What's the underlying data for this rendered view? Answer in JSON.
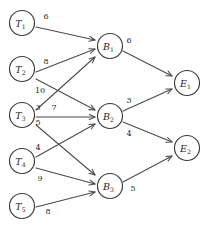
{
  "diagram": {
    "type": "directed-graph",
    "stroke_color": "#4a4a4a",
    "node_fill": "#ffffff",
    "text_color": "#1f1f1f",
    "node_radius": 12.5,
    "layers": [
      {
        "name": "sources",
        "prefix": "T",
        "nodes": [
          {
            "id": "T1",
            "base": "T",
            "sub": "1",
            "cx": 22,
            "cy": 23
          },
          {
            "id": "T2",
            "base": "T",
            "sub": "2",
            "cx": 22,
            "cy": 69
          },
          {
            "id": "T3",
            "base": "T",
            "sub": "3",
            "cx": 22,
            "cy": 115
          },
          {
            "id": "T4",
            "base": "T",
            "sub": "4",
            "cx": 22,
            "cy": 161
          },
          {
            "id": "T5",
            "base": "T",
            "sub": "5",
            "cx": 22,
            "cy": 206
          }
        ]
      },
      {
        "name": "intermediate",
        "prefix": "B",
        "nodes": [
          {
            "id": "B1",
            "base": "B",
            "sub": "1",
            "cx": 110,
            "cy": 46
          },
          {
            "id": "B2",
            "base": "B",
            "sub": "2",
            "cx": 110,
            "cy": 116
          },
          {
            "id": "B3",
            "base": "B",
            "sub": "3",
            "cx": 110,
            "cy": 186
          }
        ]
      },
      {
        "name": "sinks",
        "prefix": "E",
        "nodes": [
          {
            "id": "E1",
            "base": "E",
            "sub": "1",
            "cx": 187,
            "cy": 83
          },
          {
            "id": "E2",
            "base": "E",
            "sub": "2",
            "cx": 187,
            "cy": 148
          }
        ]
      }
    ],
    "edges": [
      {
        "id": "T1-B1",
        "from": "T1",
        "to": "B1",
        "weight": "6",
        "x1": 36,
        "y1": 27,
        "x2": 95,
        "y2": 40,
        "lx": 46,
        "ly": 16
      },
      {
        "id": "T2-B1",
        "from": "T2",
        "to": "B1",
        "weight": "8",
        "x1": 36,
        "y1": 72,
        "x2": 95,
        "y2": 49,
        "lx": 46,
        "ly": 61
      },
      {
        "id": "T2-B2",
        "from": "T2",
        "to": "B2",
        "weight": "10",
        "x1": 36,
        "y1": 79,
        "x2": 95,
        "y2": 110,
        "lx": 40,
        "ly": 90
      },
      {
        "id": "T3-B1",
        "from": "T3",
        "to": "B1",
        "weight": "3",
        "x1": 36,
        "y1": 110,
        "x2": 95,
        "y2": 57,
        "lx": 38,
        "ly": 107
      },
      {
        "id": "T3-B2",
        "from": "T3",
        "to": "B2",
        "weight": "7",
        "x1": 36,
        "y1": 117,
        "x2": 95,
        "y2": 117,
        "lx": 54,
        "ly": 107
      },
      {
        "id": "T3-B3",
        "from": "T3",
        "to": "B3",
        "weight": "5",
        "x1": 36,
        "y1": 125,
        "x2": 95,
        "y2": 175,
        "lx": 38,
        "ly": 122
      },
      {
        "id": "T4-B2",
        "from": "T4",
        "to": "B2",
        "weight": "4",
        "x1": 36,
        "y1": 157,
        "x2": 95,
        "y2": 124,
        "lx": 38,
        "ly": 147
      },
      {
        "id": "T4-B3",
        "from": "T4",
        "to": "B3",
        "weight": "9",
        "x1": 36,
        "y1": 168,
        "x2": 95,
        "y2": 184,
        "lx": 40,
        "ly": 178
      },
      {
        "id": "T5-B3",
        "from": "T5",
        "to": "B3",
        "weight": "8",
        "x1": 36,
        "y1": 207,
        "x2": 95,
        "y2": 192,
        "lx": 48,
        "ly": 211
      },
      {
        "id": "B1-E1",
        "from": "B1",
        "to": "E1",
        "weight": "6",
        "x1": 123,
        "y1": 51,
        "x2": 172,
        "y2": 76,
        "lx": 129,
        "ly": 40
      },
      {
        "id": "B2-E1",
        "from": "B2",
        "to": "E1",
        "weight": "3",
        "x1": 123,
        "y1": 111,
        "x2": 172,
        "y2": 89,
        "lx": 129,
        "ly": 100
      },
      {
        "id": "B2-E2",
        "from": "B2",
        "to": "E2",
        "weight": "4",
        "x1": 123,
        "y1": 122,
        "x2": 172,
        "y2": 142,
        "lx": 129,
        "ly": 133
      },
      {
        "id": "B3-E2",
        "from": "B3",
        "to": "E2",
        "weight": "5",
        "x1": 123,
        "y1": 182,
        "x2": 172,
        "y2": 156,
        "lx": 133,
        "ly": 188
      }
    ]
  }
}
